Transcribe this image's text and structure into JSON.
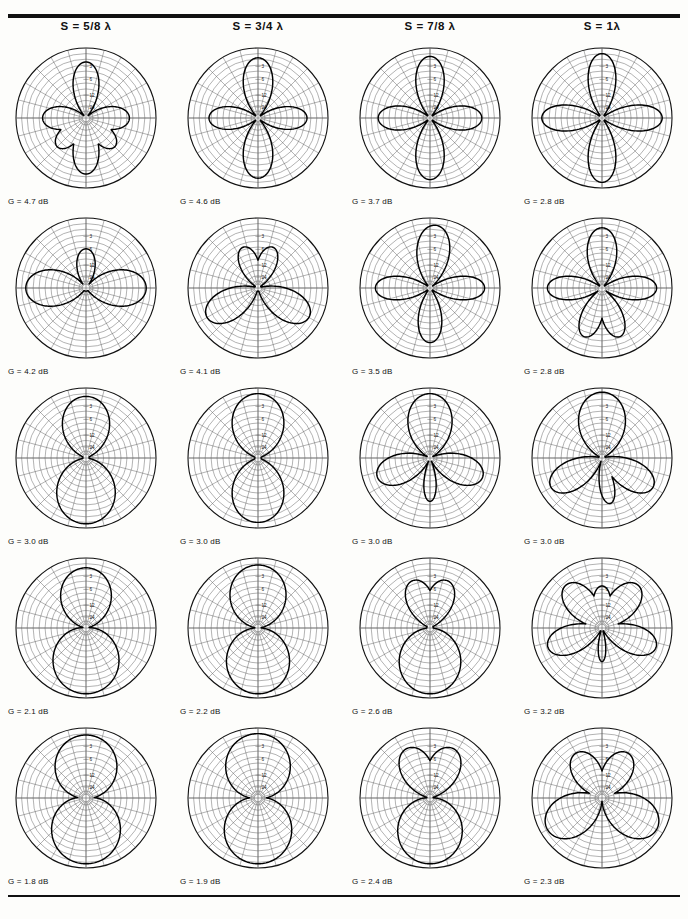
{
  "figure": {
    "type": "polar-pattern-grid",
    "rows": 5,
    "cols": 4,
    "radial_scale_labels": [
      "3",
      "6",
      "12",
      "24"
    ],
    "radial_scale_unit": "dB",
    "gain_prefix": "G  =  ",
    "gain_suffix": " dB"
  },
  "columns": [
    {
      "label_prefix": "S  =  ",
      "spacing": "5/8",
      "lambda": "λ"
    },
    {
      "label_prefix": "S  =  ",
      "spacing": "3/4",
      "lambda": "λ"
    },
    {
      "label_prefix": "S  =  ",
      "spacing": "7/8",
      "lambda": "λ"
    },
    {
      "label_prefix": "S  =  ",
      "spacing": "1",
      "lambda": "λ"
    }
  ],
  "column_headers": [
    "S  =  5/8 λ",
    "S  =  3/4 λ",
    "S  =  7/8 λ",
    "S  =  1λ"
  ],
  "chart_data": {
    "type": "line",
    "title": "",
    "subtitle": "",
    "xlabel": "",
    "ylabel": "",
    "grid": true,
    "legend_position": "none",
    "polar": true,
    "radial_ticks": [
      3,
      6,
      12,
      24
    ],
    "radial_tick_unit": "dB below peak",
    "angular_spokes": 24,
    "angular_spoke_step_deg": 15,
    "panels": [
      {
        "row": 1,
        "col": 1,
        "header": "S  =  5/8 λ",
        "gain_db": 4.7,
        "gain_label": "G  =  4.7 dB",
        "lobes": 4,
        "lobe_angles_deg": [
          90,
          0,
          270,
          180
        ],
        "lobe_radii": [
          0.8,
          0.62,
          0.8,
          0.62
        ],
        "lobe_widths_deg": [
          30,
          34,
          30,
          34
        ],
        "extra_lobes": [
          {
            "angle_deg": 135,
            "radius": 0.58,
            "width_deg": 30
          },
          {
            "angle_deg": 45,
            "radius": 0.58,
            "width_deg": 30
          }
        ]
      },
      {
        "row": 1,
        "col": 2,
        "header": "S  =  3/4 λ",
        "gain_db": 4.6,
        "gain_label": "G  =  4.6 dB",
        "lobes": 4,
        "lobe_angles_deg": [
          90,
          0,
          270,
          180
        ],
        "lobe_radii": [
          0.86,
          0.7,
          0.86,
          0.7
        ],
        "lobe_widths_deg": [
          32,
          30,
          32,
          30
        ],
        "extra_lobes": []
      },
      {
        "row": 1,
        "col": 3,
        "header": "S  =  7/8 λ",
        "gain_db": 3.7,
        "gain_label": "G  =  3.7 dB",
        "lobes": 4,
        "lobe_angles_deg": [
          90,
          0,
          270,
          180
        ],
        "lobe_radii": [
          0.88,
          0.74,
          0.88,
          0.74
        ],
        "lobe_widths_deg": [
          30,
          30,
          30,
          30
        ],
        "extra_lobes": []
      },
      {
        "row": 1,
        "col": 4,
        "header": "S  =  1λ",
        "gain_db": 2.8,
        "gain_label": "G  =  2.8 dB",
        "lobes": 4,
        "lobe_angles_deg": [
          90,
          0,
          270,
          180
        ],
        "lobe_radii": [
          0.92,
          0.86,
          0.92,
          0.86
        ],
        "lobe_widths_deg": [
          28,
          28,
          28,
          28
        ],
        "extra_lobes": []
      },
      {
        "row": 2,
        "col": 1,
        "header": "S  =  5/8 λ",
        "gain_db": 4.2,
        "gain_label": "G  =  4.2 dB",
        "lobes": 3,
        "lobe_angles_deg": [
          180,
          0,
          270
        ],
        "lobe_radii": [
          0.86,
          0.86,
          0.56
        ],
        "lobe_widths_deg": [
          40,
          40,
          30
        ],
        "extra_lobes": []
      },
      {
        "row": 2,
        "col": 2,
        "header": "S  =  3/4 λ",
        "gain_db": 4.1,
        "gain_label": "G  =  4.1 dB",
        "lobes": 4,
        "lobe_angles_deg": [
          150,
          30,
          250,
          290
        ],
        "lobe_radii": [
          0.84,
          0.84,
          0.62,
          0.62
        ],
        "lobe_widths_deg": [
          34,
          34,
          28,
          28
        ],
        "extra_lobes": []
      },
      {
        "row": 2,
        "col": 3,
        "header": "S  =  7/8 λ",
        "gain_db": 3.5,
        "gain_label": "G  =  3.5 dB",
        "lobes": 4,
        "lobe_angles_deg": [
          90,
          0,
          265,
          180
        ],
        "lobe_radii": [
          0.78,
          0.78,
          0.9,
          0.78
        ],
        "lobe_widths_deg": [
          28,
          28,
          34,
          28
        ],
        "extra_lobes": []
      },
      {
        "row": 2,
        "col": 4,
        "header": "S  =  1λ",
        "gain_db": 2.8,
        "gain_label": "G  =  2.8 dB",
        "lobes": 5,
        "lobe_angles_deg": [
          110,
          70,
          0,
          180,
          270
        ],
        "lobe_radii": [
          0.74,
          0.74,
          0.78,
          0.78,
          0.86
        ],
        "lobe_widths_deg": [
          26,
          26,
          28,
          28,
          32
        ],
        "extra_lobes": []
      },
      {
        "row": 3,
        "col": 1,
        "header": "S  =  5/8 λ",
        "gain_db": 3.0,
        "gain_label": "G  =  3.0 dB",
        "lobes": 2,
        "lobe_angles_deg": [
          90,
          270
        ],
        "lobe_radii": [
          0.94,
          0.88
        ],
        "lobe_widths_deg": [
          62,
          52
        ],
        "extra_lobes": []
      },
      {
        "row": 3,
        "col": 2,
        "header": "S  =  3/4 λ",
        "gain_db": 3.0,
        "gain_label": "G  =  3.0 dB",
        "lobes": 2,
        "lobe_angles_deg": [
          90,
          270
        ],
        "lobe_radii": [
          0.92,
          0.92
        ],
        "lobe_widths_deg": [
          55,
          55
        ],
        "extra_lobes": []
      },
      {
        "row": 3,
        "col": 3,
        "header": "S  =  7/8 λ",
        "gain_db": 3.0,
        "gain_label": "G  =  3.0 dB",
        "lobes": 4,
        "lobe_angles_deg": [
          90,
          160,
          20,
          270
        ],
        "lobe_radii": [
          0.62,
          0.8,
          0.8,
          0.92
        ],
        "lobe_widths_deg": [
          18,
          34,
          34,
          46
        ],
        "extra_lobes": []
      },
      {
        "row": 3,
        "col": 4,
        "header": "S  =  1λ",
        "gain_db": 3.0,
        "gain_label": "G  =  3.0 dB",
        "lobes": 4,
        "lobe_angles_deg": [
          100,
          150,
          30,
          270
        ],
        "lobe_radii": [
          0.66,
          0.84,
          0.84,
          0.94
        ],
        "lobe_widths_deg": [
          20,
          32,
          32,
          48
        ],
        "extra_lobes": []
      },
      {
        "row": 4,
        "col": 1,
        "header": "S  =  5/8 λ",
        "gain_db": 2.1,
        "gain_label": "G  =  2.1 dB",
        "lobes": 2,
        "lobe_angles_deg": [
          90,
          270
        ],
        "lobe_radii": [
          0.94,
          0.86
        ],
        "lobe_widths_deg": [
          72,
          58
        ],
        "extra_lobes": []
      },
      {
        "row": 4,
        "col": 2,
        "header": "S  =  3/4 λ",
        "gain_db": 2.2,
        "gain_label": "G  =  2.2 dB",
        "lobes": 2,
        "lobe_angles_deg": [
          90,
          270
        ],
        "lobe_radii": [
          0.94,
          0.9
        ],
        "lobe_widths_deg": [
          68,
          62
        ],
        "extra_lobes": []
      },
      {
        "row": 4,
        "col": 3,
        "header": "S  =  7/8 λ",
        "gain_db": 2.6,
        "gain_label": "G  =  2.6 dB",
        "lobes": 3,
        "lobe_angles_deg": [
          90,
          250,
          290
        ],
        "lobe_radii": [
          0.94,
          0.72,
          0.72
        ],
        "lobe_widths_deg": [
          66,
          34,
          34
        ],
        "extra_lobes": []
      },
      {
        "row": 4,
        "col": 4,
        "header": "S  =  1λ",
        "gain_db": 3.2,
        "gain_label": "G  =  3.2 dB",
        "lobes": 5,
        "lobe_angles_deg": [
          90,
          160,
          20,
          230,
          310
        ],
        "lobe_radii": [
          0.48,
          0.82,
          0.82,
          0.8,
          0.8
        ],
        "lobe_widths_deg": [
          14,
          32,
          32,
          34,
          34
        ],
        "extra_lobes": [
          {
            "angle_deg": 270,
            "radius": 0.6,
            "width_deg": 26
          }
        ]
      },
      {
        "row": 5,
        "col": 1,
        "header": "S  =  5/8 λ",
        "gain_db": 1.8,
        "gain_label": "G  =  1.8 dB",
        "lobes": 2,
        "lobe_angles_deg": [
          90,
          270
        ],
        "lobe_radii": [
          0.94,
          0.9
        ],
        "lobe_widths_deg": [
          76,
          70
        ],
        "extra_lobes": []
      },
      {
        "row": 5,
        "col": 2,
        "header": "S  =  3/4 λ",
        "gain_db": 1.9,
        "gain_label": "G  =  1.9 dB",
        "lobes": 2,
        "lobe_angles_deg": [
          90,
          270
        ],
        "lobe_radii": [
          0.94,
          0.92
        ],
        "lobe_widths_deg": [
          74,
          72
        ],
        "extra_lobes": []
      },
      {
        "row": 5,
        "col": 3,
        "header": "S  =  7/8 λ",
        "gain_db": 2.4,
        "gain_label": "G  =  2.4 dB",
        "lobes": 3,
        "lobe_angles_deg": [
          90,
          245,
          295
        ],
        "lobe_radii": [
          0.94,
          0.78,
          0.78
        ],
        "lobe_widths_deg": [
          70,
          38,
          38
        ],
        "extra_lobes": []
      },
      {
        "row": 5,
        "col": 4,
        "header": "S  =  1λ",
        "gain_db": 2.3,
        "gain_label": "G  =  2.3 dB",
        "lobes": 4,
        "lobe_angles_deg": [
          150,
          30,
          240,
          300
        ],
        "lobe_radii": [
          0.9,
          0.9,
          0.74,
          0.74
        ],
        "lobe_widths_deg": [
          44,
          44,
          36,
          36
        ],
        "extra_lobes": []
      }
    ]
  }
}
